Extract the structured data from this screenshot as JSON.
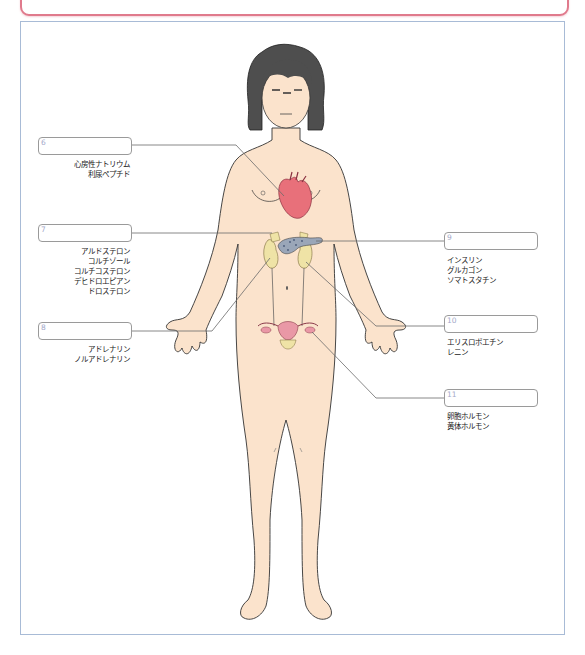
{
  "diagram": {
    "colors": {
      "banner_border": "#e07a8c",
      "frame_border": "#a8bbd6",
      "skin": "#fbe3cc",
      "hair": "#4a4a4a",
      "heart": "#e8707a",
      "adrenal": "#efe3a6",
      "pancreas": "#9aa6b8",
      "uterus": "#e998a6",
      "leader_line": "#6b6b6b",
      "label_number": "#a3a8c9"
    },
    "labels": [
      {
        "number": "6",
        "side": "left",
        "organ": "heart",
        "hormones": [
          "心房性ナトリウム",
          "利尿ペプチド"
        ]
      },
      {
        "number": "7",
        "side": "left",
        "organ": "adrenal-cortex",
        "hormones": [
          "アルドステロン",
          "コルチゾール",
          "コルチコステロン",
          "デヒドロエピアン",
          "ドロステロン"
        ]
      },
      {
        "number": "8",
        "side": "left",
        "organ": "adrenal-medulla",
        "hormones": [
          "アドレナリン",
          "ノルアドレナリン"
        ]
      },
      {
        "number": "9",
        "side": "right",
        "organ": "pancreas",
        "hormones": [
          "インスリン",
          "グルカゴン",
          "ソマトスタチン"
        ]
      },
      {
        "number": "10",
        "side": "right",
        "organ": "kidney",
        "hormones": [
          "エリスロポエチン",
          "レニン"
        ]
      },
      {
        "number": "11",
        "side": "right",
        "organ": "ovary",
        "hormones": [
          "卵胞ホルモン",
          "黄体ホルモン"
        ]
      }
    ]
  }
}
